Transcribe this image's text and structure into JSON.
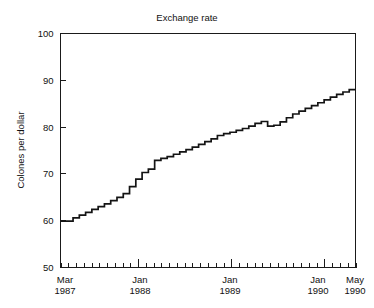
{
  "chart_data": {
    "type": "line",
    "title": "Exchange rate",
    "xlabel": "",
    "ylabel": "Colones per dollar",
    "ylim": [
      50,
      100
    ],
    "yticks": [
      50,
      60,
      70,
      80,
      90,
      100
    ],
    "ytick_labels": [
      "50",
      "60",
      "70",
      "80",
      "90",
      "100"
    ],
    "xtick_labels": [
      {
        "month": "Mar",
        "year": "1987"
      },
      {
        "month": "Jan",
        "year": "1988"
      },
      {
        "month": "Jan",
        "year": "1989"
      },
      {
        "month": "Jan",
        "year": "1990"
      },
      {
        "month": "May",
        "year": "1990"
      }
    ],
    "xlim_labels": [
      "Mar 1987",
      "May 1990"
    ],
    "grid": false,
    "legend": "none",
    "x_unit": "month",
    "x": [
      "1987-03",
      "1987-04",
      "1987-05",
      "1987-06",
      "1987-07",
      "1987-08",
      "1987-09",
      "1987-10",
      "1987-11",
      "1987-12",
      "1988-01",
      "1988-02",
      "1988-03",
      "1988-04",
      "1988-05",
      "1988-06",
      "1988-07",
      "1988-08",
      "1988-09",
      "1988-10",
      "1988-11",
      "1988-12",
      "1989-01",
      "1989-02",
      "1989-03",
      "1989-04",
      "1989-05",
      "1989-06",
      "1989-07",
      "1989-08",
      "1989-09",
      "1989-10",
      "1989-11",
      "1989-12",
      "1990-01",
      "1990-02",
      "1990-03",
      "1990-04",
      "1990-05"
    ],
    "values": [
      59.9,
      59.9,
      60.6,
      61.2,
      61.8,
      62.4,
      63.0,
      63.6,
      64.3,
      65.0,
      65.8,
      67.3,
      68.9,
      70.3,
      71.0,
      72.9,
      73.3,
      73.7,
      74.2,
      74.7,
      75.2,
      75.7,
      76.3,
      76.9,
      77.5,
      78.2,
      78.6,
      78.9,
      79.3,
      79.7,
      80.2,
      80.8,
      81.2,
      80.2,
      80.4,
      81.1,
      82.0,
      82.8,
      83.4
    ],
    "values_tail": [
      84.0,
      84.6,
      85.2,
      85.8,
      86.4,
      87.0,
      87.5,
      88.0
    ],
    "annotations": [
      {
        "text": "step-shaped monthly series",
        "visible": false
      }
    ],
    "series_name": "Colones per dollar"
  },
  "figure": {
    "background_color": "#ffffff",
    "line_color": "#141414",
    "axis_color": "#1a1a1a",
    "text_color": "#111111"
  }
}
